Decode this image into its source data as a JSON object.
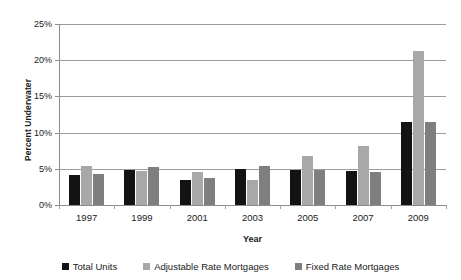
{
  "chart_data": {
    "type": "bar",
    "title": "",
    "xlabel": "Year",
    "ylabel": "Percent Underwater",
    "categories": [
      "1997",
      "1999",
      "2001",
      "2003",
      "2005",
      "2007",
      "2009"
    ],
    "series": [
      {
        "name": "Total Units",
        "color": "#131313",
        "values": [
          4.1,
          4.9,
          3.5,
          5.0,
          4.9,
          4.7,
          11.5
        ]
      },
      {
        "name": "Adjustable Rate Mortgages",
        "color": "#a8a8a8",
        "values": [
          5.4,
          4.7,
          4.6,
          3.4,
          6.8,
          8.1,
          21.3
        ]
      },
      {
        "name": "Fixed Rate Mortgages",
        "color": "#7f7f7f",
        "values": [
          4.3,
          5.2,
          3.7,
          5.4,
          4.9,
          4.6,
          11.5
        ]
      }
    ],
    "ylim": [
      0,
      25
    ],
    "ytick_values": [
      0,
      5,
      10,
      15,
      20,
      25
    ],
    "ytick_labels": [
      "0%",
      "5%",
      "10%",
      "15%",
      "20%",
      "25%"
    ],
    "grid": true,
    "legend_position": "bottom"
  }
}
